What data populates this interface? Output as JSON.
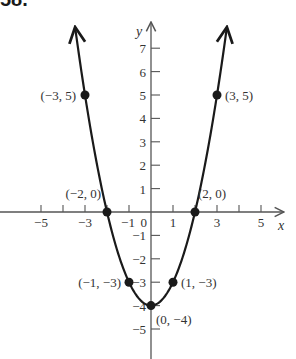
{
  "problem_number": "58.",
  "chart_data": {
    "type": "line",
    "title": "",
    "function": "y = x^2 - 4",
    "xlabel": "x",
    "ylabel": "y",
    "xlim": [
      -5.5,
      6
    ],
    "ylim": [
      -6,
      8
    ],
    "grid": false,
    "x_ticks": [
      -5,
      -4,
      -3,
      -2,
      -1,
      1,
      2,
      3,
      4,
      5
    ],
    "x_tick_labels": [
      {
        "value": -5,
        "label": "−5"
      },
      {
        "value": -3,
        "label": "−3"
      },
      {
        "value": -1,
        "label": "−1"
      },
      {
        "value": 0,
        "label": "0"
      },
      {
        "value": 1,
        "label": "1"
      },
      {
        "value": 3,
        "label": "3"
      },
      {
        "value": 5,
        "label": "5"
      }
    ],
    "y_ticks": [
      -5,
      -4,
      -3,
      -2,
      -1,
      1,
      2,
      3,
      4,
      5,
      6,
      7
    ],
    "y_tick_labels": [
      {
        "value": 7,
        "label": "7"
      },
      {
        "value": 6,
        "label": "6"
      },
      {
        "value": 5,
        "label": "5"
      },
      {
        "value": 4,
        "label": "4"
      },
      {
        "value": 3,
        "label": "3"
      },
      {
        "value": 2,
        "label": "2"
      },
      {
        "value": 1,
        "label": "1"
      },
      {
        "value": -1,
        "label": "−1"
      },
      {
        "value": -2,
        "label": "−2"
      },
      {
        "value": -3,
        "label": "−3"
      },
      {
        "value": -4,
        "label": "−4"
      },
      {
        "value": -5,
        "label": "−5"
      }
    ],
    "points": [
      {
        "x": -3,
        "y": 5,
        "label": "(−3, 5)"
      },
      {
        "x": -2,
        "y": 0,
        "label": "(−2, 0)"
      },
      {
        "x": -1,
        "y": -3,
        "label": "(−1, −3)"
      },
      {
        "x": 0,
        "y": -4,
        "label": "(0, −4)"
      },
      {
        "x": 1,
        "y": -3,
        "label": "(1, −3)"
      },
      {
        "x": 2,
        "y": 0,
        "label": "(2, 0)"
      },
      {
        "x": 3,
        "y": 5,
        "label": "(3, 5)"
      }
    ],
    "curve_x_range": [
      -3.45,
      3.45
    ],
    "colors": {
      "curve": "#1a1a1a",
      "axis": "#555555",
      "text": "#333333"
    }
  }
}
